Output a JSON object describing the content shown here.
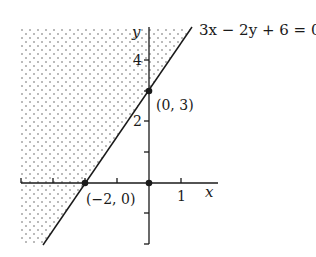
{
  "diagram": {
    "type": "linear-inequality-graph",
    "equation_label": "3x − 2y + 6 = 0",
    "axes": {
      "x_label": "x",
      "y_label": "y",
      "x_tick_labels": [
        {
          "value": 1,
          "text": "1"
        }
      ],
      "y_tick_labels": [
        {
          "value": 4,
          "text": "4"
        },
        {
          "value": 2,
          "text": "2"
        }
      ],
      "x_ticks": [
        -3,
        -2,
        -1,
        0,
        1
      ],
      "y_ticks": [
        -2,
        -1,
        1,
        2,
        3,
        4
      ],
      "x_range": [
        -4,
        2
      ],
      "y_range": [
        -2,
        5
      ]
    },
    "points": [
      {
        "name": "y-intercept",
        "x": 0,
        "y": 3,
        "label": "(0, 3)"
      },
      {
        "name": "x-intercept",
        "x": -2,
        "y": 0,
        "label": "(−2, 0)"
      },
      {
        "name": "origin",
        "x": 0,
        "y": 0,
        "label": ""
      }
    ],
    "shaded_region": {
      "description": "Half-plane above/left of the line (3x − 2y + 6 < 0)",
      "pattern": "dotted"
    },
    "colors": {
      "line": "#1a1a1a",
      "dots": "#555555",
      "background": "#ffffff"
    }
  }
}
